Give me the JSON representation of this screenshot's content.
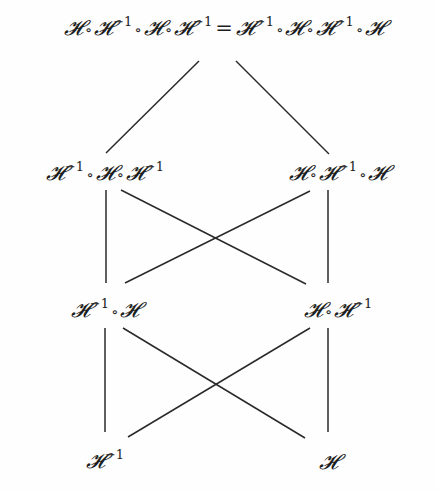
{
  "diagram": {
    "type": "hasse-lattice",
    "nodes": [
      {
        "id": "top",
        "label": "𝓗∘𝓗⁻¹∘𝓗∘𝓗⁻¹ = 𝓗⁻¹∘𝓗∘𝓗⁻¹∘𝓗",
        "x": 224,
        "y": 27
      },
      {
        "id": "row2-left",
        "label": "𝓗⁻¹∘𝓗∘𝓗⁻¹",
        "x": 105,
        "y": 172
      },
      {
        "id": "row2-right",
        "label": "𝓗∘𝓗⁻¹∘𝓗",
        "x": 338,
        "y": 172
      },
      {
        "id": "row3-left",
        "label": "𝓗⁻¹∘𝓗",
        "x": 105,
        "y": 309
      },
      {
        "id": "row3-right",
        "label": "𝓗∘𝓗⁻¹",
        "x": 338,
        "y": 309
      },
      {
        "id": "bottom-left",
        "label": "𝓗⁻¹",
        "x": 105,
        "y": 460
      },
      {
        "id": "bottom-right",
        "label": "𝓗",
        "x": 328,
        "y": 462
      }
    ],
    "edges": [
      {
        "from": "top",
        "to": "row2-left",
        "x1": 199,
        "y1": 61,
        "x2": 106,
        "y2": 153
      },
      {
        "from": "top",
        "to": "row2-right",
        "x1": 236,
        "y1": 61,
        "x2": 329,
        "y2": 154
      },
      {
        "from": "row2-left",
        "to": "row3-left",
        "x1": 106,
        "y1": 190,
        "x2": 106,
        "y2": 283
      },
      {
        "from": "row2-left",
        "to": "row3-right",
        "x1": 121,
        "y1": 190,
        "x2": 306,
        "y2": 284
      },
      {
        "from": "row2-right",
        "to": "row3-left",
        "x1": 310,
        "y1": 191,
        "x2": 125,
        "y2": 283
      },
      {
        "from": "row2-right",
        "to": "row3-right",
        "x1": 328,
        "y1": 190,
        "x2": 328,
        "y2": 283
      },
      {
        "from": "row3-left",
        "to": "bottom-left",
        "x1": 105,
        "y1": 328,
        "x2": 105,
        "y2": 432
      },
      {
        "from": "row3-left",
        "to": "bottom-right",
        "x1": 123,
        "y1": 328,
        "x2": 305,
        "y2": 438
      },
      {
        "from": "row3-right",
        "to": "bottom-left",
        "x1": 310,
        "y1": 328,
        "x2": 128,
        "y2": 437
      },
      {
        "from": "row3-right",
        "to": "bottom-right",
        "x1": 328,
        "y1": 328,
        "x2": 328,
        "y2": 432
      }
    ],
    "symbols": {
      "H": "𝓗",
      "compose": "∘",
      "inverse_exp": "−1",
      "equals": "="
    },
    "colors": {
      "ink": "#2a2a2a",
      "background": "#fefefe"
    }
  }
}
